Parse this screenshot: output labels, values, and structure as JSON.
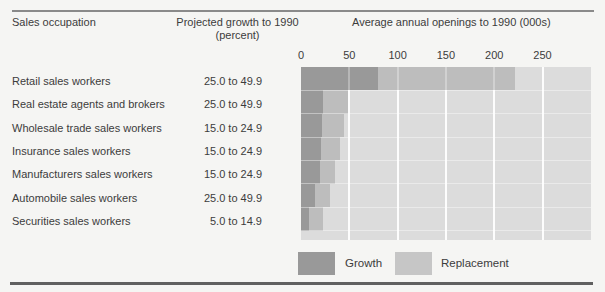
{
  "header": {
    "occupation_col": "Sales occupation",
    "growth_col_line1": "Projected growth to 1990",
    "growth_col_line2": "(percent)",
    "openings_col": "Average annual openings to 1990 (000s)"
  },
  "rows": [
    {
      "occupation": "Retail sales workers",
      "growth_pct": "25.0 to 49.9",
      "growth": 80,
      "replacement": 142
    },
    {
      "occupation": "Real estate agents and brokers",
      "growth_pct": "25.0 to 49.9",
      "growth": 23,
      "replacement": 26
    },
    {
      "occupation": "Wholesale trade sales workers",
      "growth_pct": "15.0 to 24.9",
      "growth": 22,
      "replacement": 23
    },
    {
      "occupation": "Insurance sales workers",
      "growth_pct": "15.0 to 24.9",
      "growth": 21,
      "replacement": 19
    },
    {
      "occupation": "Manufacturers sales workers",
      "growth_pct": "15.0 to 24.9",
      "growth": 20,
      "replacement": 15
    },
    {
      "occupation": "Automobile sales workers",
      "growth_pct": "25.0 to 49.9",
      "growth": 14,
      "replacement": 16
    },
    {
      "occupation": "Securities sales workers",
      "growth_pct": "5.0 to 14.9",
      "growth": 8,
      "replacement": 15
    }
  ],
  "axis": {
    "ticks": [
      0,
      50,
      100,
      150,
      200,
      250
    ],
    "max": 300
  },
  "legend": {
    "growth_label": "Growth",
    "replacement_label": "Replacement"
  },
  "colors": {
    "growth_bar": "#999999",
    "replacement_bar": "#bdbdbd",
    "replacement_legend": "#c6c6c6",
    "plot_background": "#dcdcdc",
    "rule": "#8a8a8a",
    "bottom_rule": "#606060"
  },
  "chart_data": {
    "type": "bar",
    "orientation": "horizontal",
    "stacked": true,
    "title": "Average annual openings to 1990 (000s)",
    "categories": [
      "Retail sales workers",
      "Real estate agents and brokers",
      "Wholesale trade sales workers",
      "Insurance sales workers",
      "Manufacturers sales workers",
      "Automobile sales workers",
      "Securities sales workers"
    ],
    "series": [
      {
        "name": "Growth",
        "values": [
          80,
          23,
          22,
          21,
          20,
          14,
          8
        ]
      },
      {
        "name": "Replacement",
        "values": [
          142,
          26,
          23,
          19,
          15,
          16,
          15
        ]
      }
    ],
    "totals": [
      222,
      49,
      45,
      40,
      35,
      30,
      23
    ],
    "xlabel": "Average annual openings to 1990 (000s)",
    "xlim": [
      0,
      300
    ],
    "xticks": [
      0,
      50,
      100,
      150,
      200,
      250
    ],
    "grid": true,
    "legend_position": "bottom",
    "companion_column": {
      "label": "Projected growth to 1990 (percent)",
      "values": [
        "25.0 to 49.9",
        "25.0 to 49.9",
        "15.0 to 24.9",
        "15.0 to 24.9",
        "15.0 to 24.9",
        "25.0 to 49.9",
        "5.0 to 14.9"
      ]
    }
  }
}
